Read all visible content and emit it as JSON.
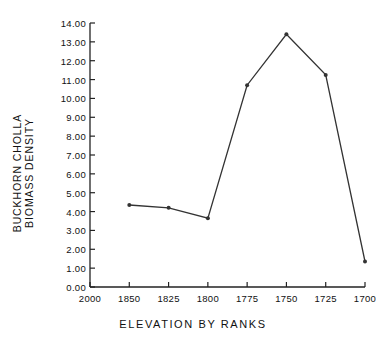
{
  "chart_data": {
    "type": "line",
    "title": "",
    "xlabel": "ELEVATION BY RANKS",
    "ylabel_line1": "BUCKHORN CHOLLA",
    "ylabel_line2": "BIOMASS DENSITY",
    "x_tick_labels": [
      "2000",
      "1850",
      "1825",
      "1800",
      "1775",
      "1750",
      "1725",
      "1700"
    ],
    "y_tick_labels": [
      "0.00",
      "1.00",
      "2.00",
      "3.00",
      "4.00",
      "5.00",
      "6.00",
      "7.00",
      "8.00",
      "9.00",
      "10.00",
      "11.00",
      "12.00",
      "13.00",
      "14.00"
    ],
    "y_tick_values": [
      0,
      1,
      2,
      3,
      4,
      5,
      6,
      7,
      8,
      9,
      10,
      11,
      12,
      13,
      14
    ],
    "ylim": [
      0,
      14
    ],
    "xlim_ticks": [
      0,
      7
    ],
    "grid": false,
    "legend": false,
    "marker": "filled-circle",
    "line_color": "#333333",
    "categories": [
      "1850",
      "1825",
      "1800",
      "1775",
      "1750",
      "1725",
      "1700"
    ],
    "values": [
      4.35,
      4.2,
      3.65,
      10.7,
      13.4,
      11.25,
      1.35
    ],
    "points": [
      {
        "x_label": "1850",
        "x_index": 1,
        "y": 4.35
      },
      {
        "x_label": "1825",
        "x_index": 2,
        "y": 4.2
      },
      {
        "x_label": "1800",
        "x_index": 3,
        "y": 3.65
      },
      {
        "x_label": "1775",
        "x_index": 4,
        "y": 10.7
      },
      {
        "x_label": "1750",
        "x_index": 5,
        "y": 13.4
      },
      {
        "x_label": "1725",
        "x_index": 6,
        "y": 11.25
      },
      {
        "x_label": "1700",
        "x_index": 7,
        "y": 1.35
      }
    ]
  }
}
